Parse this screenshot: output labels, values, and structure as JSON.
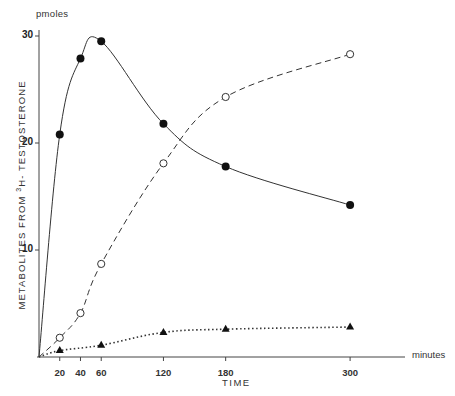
{
  "chart_data": {
    "type": "line",
    "title": "",
    "xlabel": "TIME",
    "x_unit": "minutes",
    "ylabel": "METABOLITES FROM 3H- TESTOSTERONE",
    "ylabel_parts": {
      "before": "METABOLITES   FROM   ",
      "sup": "3",
      "after": "H- TESTOSTERONE"
    },
    "y_unit": "pmoles",
    "xlim": [
      0,
      360
    ],
    "ylim": [
      0,
      31
    ],
    "x_ticks": [
      20,
      40,
      60,
      120,
      180,
      300
    ],
    "y_ticks": [
      10,
      20,
      30
    ],
    "grid": false,
    "legend": null,
    "series": [
      {
        "name": "filled circles (solid line)",
        "marker": "filled-circle",
        "line_style": "solid",
        "x": [
          0,
          20,
          40,
          60,
          120,
          180,
          300
        ],
        "y": [
          0,
          20.8,
          27.9,
          29.5,
          21.8,
          17.8,
          14.2
        ]
      },
      {
        "name": "open circles (dashed line)",
        "marker": "open-circle",
        "line_style": "dashed",
        "x": [
          0,
          20,
          40,
          60,
          120,
          180,
          300
        ],
        "y": [
          0,
          1.8,
          4.1,
          8.7,
          18.1,
          24.3,
          28.3
        ]
      },
      {
        "name": "filled triangles (dotted line)",
        "marker": "filled-triangle",
        "line_style": "dotted",
        "x": [
          0,
          20,
          60,
          120,
          180,
          300
        ],
        "y": [
          0,
          0.6,
          1.1,
          2.3,
          2.6,
          2.8
        ]
      }
    ]
  },
  "labels": {
    "y_unit": "pmoles",
    "x_unit": "minutes",
    "x_title": "TIME",
    "y_title_before": "METABOLITES   FROM   ",
    "y_title_sup": "3",
    "y_title_after": "H- TESTOSTERONE"
  }
}
